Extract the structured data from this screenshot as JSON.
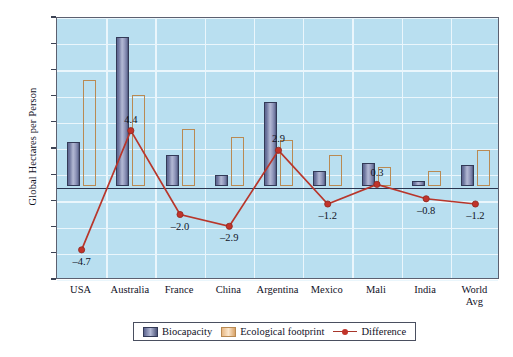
{
  "chart_data": {
    "type": "bar",
    "title": "",
    "xlabel": "",
    "ylabel": "Global Hectares per Person",
    "ylim": [
      -7.0,
      13.0
    ],
    "yticks": [
      "13.0",
      "11.0",
      "9.0",
      "7.0",
      "5.0",
      "3.0",
      "1.0",
      "–1.0",
      "–3.0",
      "–5.0",
      "–7.0"
    ],
    "ytick_values": [
      13.0,
      11.0,
      9.0,
      7.0,
      5.0,
      3.0,
      1.0,
      -1.0,
      -3.0,
      -5.0,
      -7.0
    ],
    "grid": true,
    "legend_position": "bottom",
    "categories": [
      "USA",
      "Australia",
      "France",
      "China",
      "Argentina",
      "Mexico",
      "Mali",
      "India",
      "World Avg"
    ],
    "category_lines": [
      [
        "USA"
      ],
      [
        "Australia"
      ],
      [
        "France"
      ],
      [
        "China"
      ],
      [
        "Argentina"
      ],
      [
        "Mexico"
      ],
      [
        "Mali"
      ],
      [
        "India"
      ],
      [
        "World",
        "Avg"
      ]
    ],
    "series": [
      {
        "name": "Biocapacity",
        "type": "bar",
        "color": "#8e95b8",
        "values": [
          3.4,
          11.4,
          2.4,
          0.9,
          6.4,
          1.2,
          1.8,
          0.4,
          1.6
        ]
      },
      {
        "name": "Ecological footprint",
        "type": "bar",
        "color": "#f5cfa0",
        "values": [
          8.1,
          7.0,
          4.4,
          3.8,
          3.5,
          2.4,
          1.5,
          1.2,
          2.8
        ]
      },
      {
        "name": "Difference",
        "type": "line",
        "color": "#b8362b",
        "values": [
          -4.7,
          4.4,
          -2.0,
          -2.9,
          2.9,
          -1.2,
          0.3,
          -0.8,
          -1.2
        ],
        "labels": [
          "–4.7",
          "4.4",
          "–2.0",
          "–2.9",
          "2.9",
          "–1.2",
          "0.3",
          "–0.8",
          "–1.2"
        ]
      }
    ]
  },
  "legend": {
    "items": [
      {
        "label": "Biocapacity",
        "marker": "square-swatch-blue"
      },
      {
        "label": "Ecological footprint",
        "marker": "square-swatch-peach"
      },
      {
        "label": "Difference",
        "marker": "line-marker-red"
      }
    ]
  },
  "colors": {
    "plot_background": "#b9dff0",
    "gridline": "#eaf6fc",
    "biocapacity": "#8e95b8",
    "ecological_footprint": "#f5cfa0",
    "difference": "#b8362b",
    "axis": "#5c6070"
  }
}
